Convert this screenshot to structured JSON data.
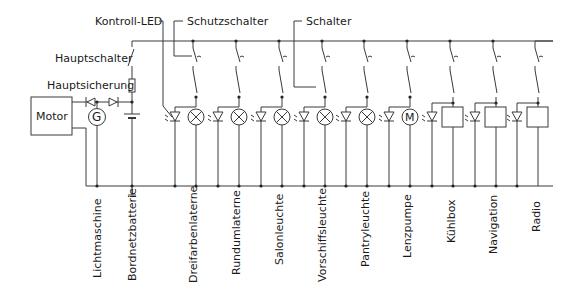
{
  "diagram": {
    "title_labels": {
      "kontroll_led": "Kontroll-LED",
      "schutzschalter": "Schutzschalter",
      "schalter": "Schalter",
      "hauptschalter": "Hauptschalter",
      "hauptsicherung": "Hauptsicherung"
    },
    "components": {
      "motor": "Motor",
      "generator_symbol": "G",
      "pump_motor_symbol": "M"
    },
    "bottom_labels": {
      "lichtmaschine": "Lichtmaschine",
      "bordnetzbatterie": "Bordnetzbatterie",
      "dreifarbenlaterne": "Dreifarbenlaterne",
      "rundumlaterne": "Rundumlaterne",
      "salonleuchte": "Salonleuchte",
      "vorschiffsleuchte": "Vorschiffsleuchte",
      "pantryleuchte": "Pantryleuchte",
      "lenzpumpe": "Lenzpumpe",
      "kuehlbox": "Kühlbox",
      "navigation": "Navigation",
      "radio": "Radio"
    },
    "circuits": [
      {
        "name": "Dreifarbenlaterne",
        "load": "lamp"
      },
      {
        "name": "Rundumlaterne",
        "load": "lamp"
      },
      {
        "name": "Salonleuchte",
        "load": "lamp"
      },
      {
        "name": "Vorschiffsleuchte",
        "load": "lamp"
      },
      {
        "name": "Pantryleuchte",
        "load": "lamp"
      },
      {
        "name": "Lenzpumpe",
        "load": "motor"
      },
      {
        "name": "Kühlbox",
        "load": "box"
      },
      {
        "name": "Navigation",
        "load": "box"
      },
      {
        "name": "Radio",
        "load": "box"
      }
    ],
    "colors": {
      "line": "#3a3a3a",
      "text": "#1a1a1a",
      "background": "#ffffff"
    }
  }
}
